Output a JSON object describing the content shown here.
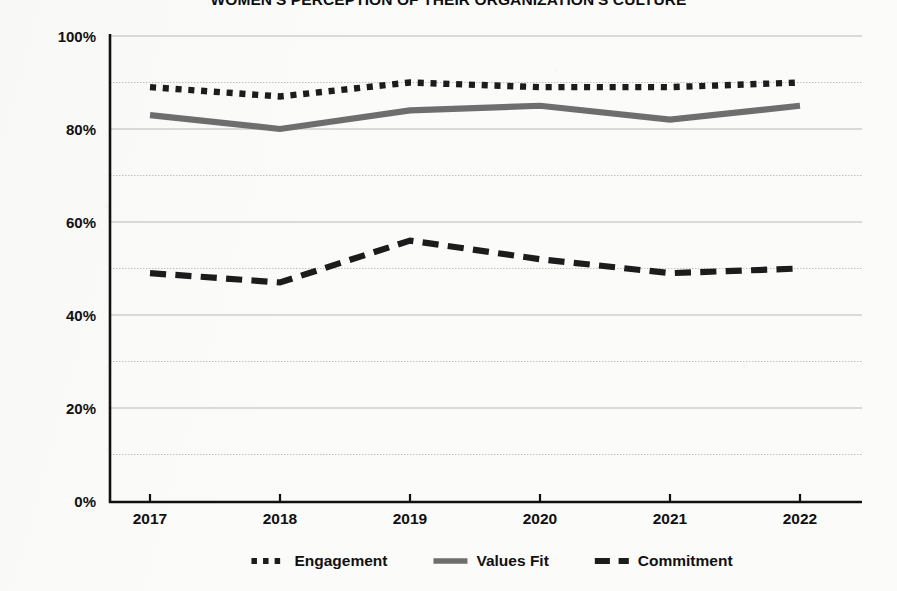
{
  "title": "WOMEN'S PERCEPTION OF THEIR ORGANIZATION'S CULTURE",
  "axes": {
    "y_ticks": [
      "100%",
      "80%",
      "60%",
      "40%",
      "20%",
      "0%"
    ],
    "x_ticks": [
      "2017",
      "2018",
      "2019",
      "2020",
      "2021",
      "2022"
    ]
  },
  "legend": {
    "items": [
      {
        "label": "Engagement",
        "style": "dotted",
        "color": "#1c1c1c",
        "swatch_icon": "dotted-line-icon"
      },
      {
        "label": "Values Fit",
        "style": "solid",
        "color": "#6e6e6e",
        "swatch_icon": "solid-line-icon"
      },
      {
        "label": "Commitment",
        "style": "dashed",
        "color": "#1c1c1c",
        "swatch_icon": "dashed-line-icon"
      }
    ]
  },
  "colors": {
    "engagement": "#1c1c1c",
    "values_fit": "#6e6e6e",
    "commitment": "#1c1c1c",
    "axis": "#111111",
    "gridline": "#b9b9b9",
    "background": "#fbfbfa"
  },
  "chart_data": {
    "type": "line",
    "title": "WOMEN'S PERCEPTION OF THEIR ORGANIZATION'S CULTURE",
    "xlabel": "",
    "ylabel": "",
    "categories": [
      "2017",
      "2018",
      "2019",
      "2020",
      "2021",
      "2022"
    ],
    "series": [
      {
        "name": "Engagement",
        "style": "dotted",
        "color": "#1c1c1c",
        "values": [
          89,
          87,
          90,
          89,
          89,
          90
        ]
      },
      {
        "name": "Values Fit",
        "style": "solid",
        "color": "#6e6e6e",
        "values": [
          83,
          80,
          84,
          85,
          82,
          85
        ]
      },
      {
        "name": "Commitment",
        "style": "dashed",
        "color": "#1c1c1c",
        "values": [
          49,
          47,
          56,
          52,
          49,
          50
        ]
      }
    ],
    "ylim": [
      0,
      100
    ],
    "y_major_ticks": [
      0,
      20,
      40,
      60,
      80,
      100
    ],
    "y_minor_ticks": [
      10,
      30,
      50,
      70,
      90
    ],
    "y_tick_format": "percent",
    "grid": true,
    "grid_axis": "y",
    "legend_position": "bottom"
  }
}
